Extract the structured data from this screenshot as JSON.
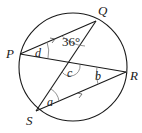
{
  "diagram": {
    "type": "circle-theorem",
    "points": {
      "P": {
        "label": "P"
      },
      "Q": {
        "label": "Q"
      },
      "R": {
        "label": "R"
      },
      "S": {
        "label": "S"
      }
    },
    "angles": {
      "d": "d",
      "given": "36°",
      "c": "c",
      "b": "b",
      "a": "a"
    }
  }
}
